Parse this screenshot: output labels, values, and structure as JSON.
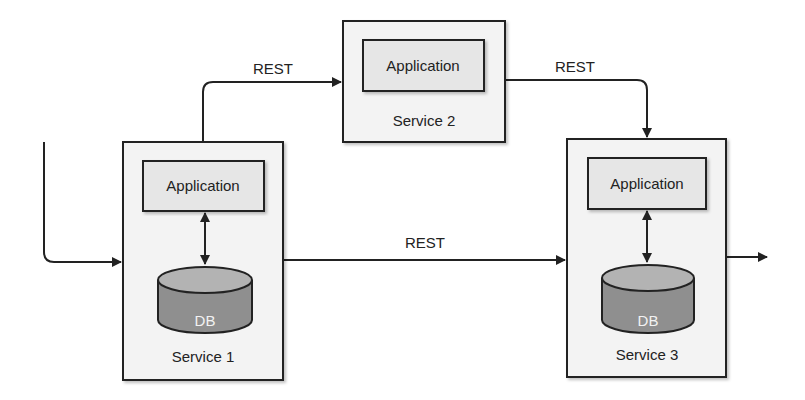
{
  "diagram": {
    "services": [
      {
        "name": "Service 1",
        "app_label": "Application",
        "db_label": "DB"
      },
      {
        "name": "Service 2",
        "app_label": "Application"
      },
      {
        "name": "Service 3",
        "app_label": "Application",
        "db_label": "DB"
      }
    ],
    "connections": [
      {
        "from": "Service 1",
        "to": "Service 2",
        "label": "REST"
      },
      {
        "from": "Service 2",
        "to": "Service 3",
        "label": "REST"
      },
      {
        "from": "Service 1",
        "to": "Service 3",
        "label": "REST"
      }
    ],
    "colors": {
      "box_fill": "#f3f3f3",
      "app_fill": "#e6e6e6",
      "db_top": "#b3b3b3",
      "db_body": "#8f8f8f",
      "stroke": "#222222"
    }
  }
}
